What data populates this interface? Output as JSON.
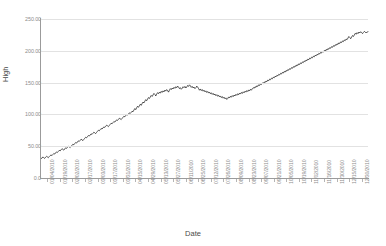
{
  "chart_data": {
    "type": "line",
    "title": "",
    "clipped_header_text": "",
    "xlabel": "Date",
    "ylabel": "High",
    "grid": true,
    "legend": false,
    "ylim": [
      0,
      250
    ],
    "yticks": [
      0,
      50,
      100,
      150,
      200,
      250
    ],
    "ytick_labels": [
      "0.0",
      "50.00",
      "100.00",
      "150.00",
      "200.00",
      "250.00"
    ],
    "xtick_labels": [
      "01/04/2010",
      "01/19/2010",
      "02/02/2010",
      "02/17/2010",
      "03/03/2010",
      "03/17/2010",
      "03/31/2010",
      "04/15/2010",
      "04/29/2010",
      "05/13/2010",
      "05/27/2010",
      "06/11/2010",
      "06/25/2010",
      "07/12/2010",
      "07/26/2010",
      "08/09/2010",
      "08/23/2010",
      "09/07/2010",
      "09/21/2010",
      "10/05/2010",
      "10/19/2010",
      "11/02/2010",
      "11/16/2010",
      "11/30/2010",
      "12/15/2010",
      "12/30/2010"
    ],
    "series": [
      {
        "name": "High",
        "color": "#111111",
        "values": [
          30.5,
          31.2,
          33.0,
          32.1,
          30.8,
          32.6,
          34.0,
          33.2,
          31.9,
          33.6,
          35.1,
          36.4,
          35.2,
          36.8,
          38.5,
          37.6,
          39.4,
          41.0,
          40.1,
          41.8,
          43.5,
          42.6,
          44.3,
          46.0,
          45.1,
          43.8,
          45.6,
          47.4,
          46.5,
          48.2,
          50.0,
          49.1,
          47.8,
          49.6,
          51.4,
          53.1,
          52.2,
          54.0,
          55.8,
          54.9,
          56.6,
          58.4,
          57.5,
          59.2,
          61.0,
          60.1,
          58.8,
          60.6,
          62.4,
          64.1,
          63.2,
          65.0,
          66.8,
          65.9,
          67.6,
          69.4,
          68.5,
          70.2,
          72.0,
          71.1,
          69.8,
          71.6,
          73.4,
          75.1,
          74.2,
          76.0,
          77.8,
          76.9,
          78.6,
          80.4,
          79.5,
          81.2,
          83.0,
          82.1,
          80.8,
          82.6,
          84.4,
          86.1,
          85.2,
          87.0,
          88.8,
          87.9,
          89.6,
          91.4,
          90.5,
          92.2,
          94.0,
          93.1,
          91.8,
          93.6,
          95.4,
          97.1,
          96.2,
          98.0,
          99.8,
          98.9,
          100.6,
          102.4,
          101.5,
          103.2,
          105.0,
          104.1,
          106.8,
          109.2,
          107.5,
          110.4,
          112.8,
          111.1,
          113.6,
          116.0,
          114.2,
          117.0,
          119.5,
          118.0,
          120.8,
          123.2,
          121.5,
          124.0,
          126.5,
          125.0,
          127.4,
          129.8,
          128.2,
          130.6,
          133.0,
          131.4,
          129.0,
          131.8,
          134.2,
          132.6,
          135.0,
          133.4,
          136.2,
          134.6,
          137.0,
          135.4,
          138.2,
          136.6,
          139.0,
          137.4,
          135.0,
          138.0,
          140.5,
          139.0,
          141.5,
          140.0,
          142.5,
          141.0,
          143.5,
          142.0,
          144.5,
          143.0,
          140.5,
          142.0,
          139.5,
          141.0,
          143.5,
          142.0,
          144.0,
          141.5,
          143.0,
          145.5,
          144.0,
          146.5,
          145.0,
          142.5,
          144.0,
          141.5,
          143.0,
          140.5,
          142.0,
          144.5,
          143.0,
          140.5,
          138.0,
          140.0,
          137.5,
          139.0,
          136.5,
          138.0,
          135.5,
          137.0,
          134.5,
          136.0,
          133.5,
          135.0,
          132.5,
          134.0,
          131.5,
          133.0,
          130.5,
          132.0,
          129.5,
          131.0,
          128.5,
          130.0,
          127.5,
          129.0,
          126.5,
          128.0,
          125.5,
          127.0,
          124.5,
          126.0,
          123.5,
          125.0,
          127.5,
          126.0,
          128.5,
          127.0,
          129.5,
          128.0,
          130.5,
          129.0,
          131.5,
          130.0,
          132.5,
          131.0,
          133.5,
          132.0,
          134.5,
          133.0,
          135.5,
          134.0,
          136.5,
          135.0,
          137.5,
          136.0,
          138.5,
          137.0,
          139.5,
          138.0,
          140.5,
          142.0,
          141.0,
          143.5,
          142.5,
          145.0,
          144.0,
          146.5,
          145.5,
          148.0,
          147.0,
          149.5,
          148.5,
          151.0,
          150.0,
          152.5,
          151.5,
          154.0,
          153.0,
          155.5,
          154.5,
          157.0,
          156.0,
          158.5,
          157.5,
          160.0,
          159.0,
          161.5,
          160.5,
          163.0,
          162.0,
          164.5,
          163.5,
          166.0,
          165.0,
          167.5,
          166.5,
          169.0,
          168.0,
          170.5,
          169.5,
          172.0,
          171.0,
          173.5,
          172.5,
          175.0,
          174.0,
          176.5,
          175.5,
          178.0,
          177.0,
          179.5,
          178.5,
          181.0,
          180.0,
          182.5,
          181.5,
          184.0,
          183.0,
          185.5,
          184.5,
          187.0,
          186.0,
          188.5,
          187.5,
          190.0,
          189.0,
          191.5,
          190.5,
          193.0,
          192.0,
          194.5,
          193.5,
          196.0,
          195.0,
          197.5,
          196.5,
          199.0,
          198.0,
          200.5,
          199.5,
          202.0,
          201.0,
          203.5,
          202.5,
          205.0,
          204.0,
          206.5,
          205.5,
          208.0,
          207.0,
          209.5,
          208.5,
          211.0,
          210.0,
          212.5,
          211.5,
          214.0,
          213.0,
          215.5,
          214.5,
          217.0,
          216.0,
          218.5,
          217.5,
          220.0,
          222.5,
          221.0,
          219.0,
          221.5,
          224.0,
          222.5,
          225.0,
          227.5,
          226.0,
          228.5,
          227.0,
          229.5,
          228.0,
          230.0,
          228.5,
          227.0,
          229.0,
          230.5,
          229.5,
          228.0,
          229.5,
          230.0
        ]
      }
    ]
  }
}
